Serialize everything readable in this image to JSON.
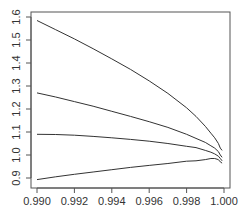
{
  "chart_data": {
    "type": "line",
    "title": "",
    "xlabel": "",
    "ylabel": "",
    "xlim": [
      0.9898,
      1.0003
    ],
    "ylim": [
      0.88,
      1.61
    ],
    "grid": false,
    "legend": null,
    "x_ticks": [
      "0.990",
      "0.992",
      "0.994",
      "0.996",
      "0.998",
      "1.000"
    ],
    "y_ticks": [
      "0.9",
      "1.0",
      "1.1",
      "1.2",
      "1.3",
      "1.4",
      "1.5",
      "1.6"
    ],
    "x": [
      0.99,
      0.991,
      0.992,
      0.993,
      0.994,
      0.995,
      0.996,
      0.997,
      0.998,
      0.9985,
      0.999,
      0.9993,
      0.9995,
      0.9997,
      0.9998,
      0.9999
    ],
    "series": [
      {
        "name": "curve-1",
        "values": [
          1.585,
          1.545,
          1.505,
          1.462,
          1.418,
          1.372,
          1.322,
          1.268,
          1.205,
          1.168,
          1.125,
          1.095,
          1.075,
          1.05,
          1.03,
          1.02
        ]
      },
      {
        "name": "curve-2",
        "values": [
          1.27,
          1.252,
          1.232,
          1.212,
          1.19,
          1.168,
          1.145,
          1.12,
          1.09,
          1.072,
          1.055,
          1.04,
          1.03,
          1.015,
          1.0,
          0.99
        ]
      },
      {
        "name": "curve-3",
        "values": [
          1.09,
          1.089,
          1.086,
          1.081,
          1.075,
          1.068,
          1.06,
          1.05,
          1.038,
          1.032,
          1.02,
          1.012,
          1.005,
          0.995,
          0.985,
          0.975
        ]
      },
      {
        "name": "curve-4",
        "values": [
          0.893,
          0.905,
          0.916,
          0.926,
          0.936,
          0.946,
          0.955,
          0.963,
          0.973,
          0.975,
          0.98,
          0.985,
          0.985,
          0.98,
          0.97,
          0.965
        ]
      }
    ]
  }
}
